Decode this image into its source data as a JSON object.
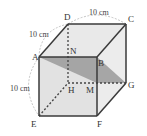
{
  "figure": {
    "type": "cube",
    "vertices": {
      "A": "A",
      "B": "B",
      "C": "C",
      "D": "D",
      "E": "E",
      "F": "F",
      "G": "G",
      "H": "H",
      "N": "N",
      "M": "M"
    },
    "dimensions": {
      "top_back_edge": "10 cm",
      "top_left_edge": "10 cm",
      "left_height": "10 cm"
    },
    "shaded_section": [
      "A",
      "B",
      "G",
      "M"
    ],
    "colors": {
      "edge": "#3a3a3a",
      "face_light": "#e6e6e6",
      "face_mid": "#d8d8d8",
      "section": "#9a9a9a",
      "dim_arc": "#999999"
    }
  }
}
